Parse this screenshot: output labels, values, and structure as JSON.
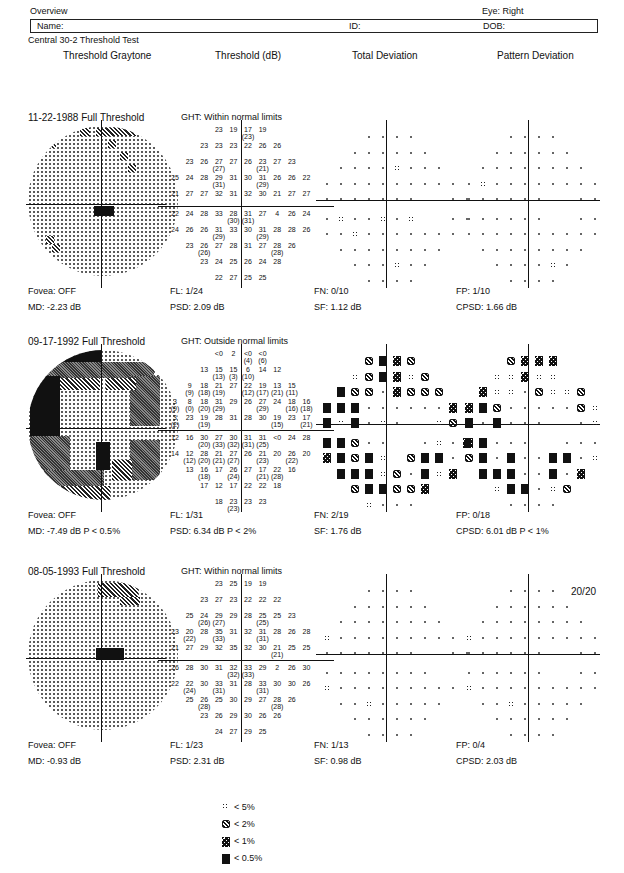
{
  "header": {
    "title": "Overview",
    "eye": "Eye: Right",
    "name_label": "Name:",
    "id_label": "ID:",
    "dob_label": "DOB:",
    "test_name": "Central 30-2 Threshold Test"
  },
  "columns": {
    "graytone": "Threshold Graytone",
    "threshold": "Threshold (dB)",
    "total_dev": "Total Deviation",
    "pattern_dev": "Pattern Deviation"
  },
  "tests": [
    {
      "date_strategy": "11-22-1988 Full Threshold",
      "ght": "GHT: Within normal limits",
      "fovea": "Fovea: OFF",
      "md": "MD:  -2.23 dB",
      "fl": "FL: 1/24",
      "psd": "PSD:  2.09 dB",
      "fn": "FN: 0/10",
      "sf": "SF:  1.12 dB",
      "fp": "FP: 1/10",
      "cpsd": "CPSD:  1.66 dB",
      "acuity": "",
      "threshold_rows": [
        [
          "",
          "",
          "",
          "23",
          "19",
          "17 (23)",
          "19",
          "",
          "",
          ""
        ],
        [
          "",
          "",
          "23",
          "23",
          "23",
          "22",
          "26",
          "26",
          "",
          ""
        ],
        [
          "",
          "23",
          "26",
          "27 (27)",
          "27",
          "26",
          "23 (21)",
          "27",
          "23",
          ""
        ],
        [
          "25",
          "24",
          "28",
          "29 (31)",
          "31",
          "30",
          "31 (29)",
          "26",
          "26",
          "22"
        ],
        [
          "21",
          "27",
          "27",
          "32",
          "31",
          "32",
          "30",
          "21",
          "27",
          "27"
        ],
        [
          "22",
          "24",
          "28",
          "33",
          "28 (30)",
          "31 (31)",
          "27",
          "4",
          "26",
          "24"
        ],
        [
          "24",
          "26",
          "26",
          "31 (29)",
          "33",
          "30",
          "31 (29)",
          "28",
          "28",
          "26"
        ],
        [
          "",
          "23",
          "26 (26)",
          "27",
          "28",
          "31",
          "27",
          "28 (28)",
          "26",
          ""
        ],
        [
          "",
          "",
          "23",
          "24",
          "25",
          "26",
          "24",
          "28",
          "",
          ""
        ],
        [
          "",
          "",
          "",
          "22",
          "27",
          "25",
          "25",
          "",
          "",
          ""
        ]
      ],
      "total_dev_rows": [
        "   ....   ",
        "  ......  ",
        " ....a... ",
        "..........",
        ".......  ..",
        ".a..a.a  ..",
        "..a.......",
        " ........ ",
        "  ...a..  ",
        "   ....   "
      ],
      "pattern_dev_rows": [
        "   ....   ",
        "  ......  ",
        " ........ ",
        ".a........",
        "......  ..",
        "......  ..",
        "..........",
        " ........ ",
        "  ....a.  ",
        "   ....   "
      ]
    },
    {
      "date_strategy": "09-17-1992 Full Threshold",
      "ght": "GHT: Outside normal limits",
      "fovea": "Fovea: OFF",
      "md": "MD:  -7.49 dB  P < 0.5%",
      "fl": "FL: 1/31",
      "psd": "PSD:  6.34 dB  P < 2%",
      "fn": "FN: 2/19",
      "sf": "SF:  1.76 dB",
      "fp": "FP: 0/18",
      "cpsd": "CPSD:  6.01 dB  P < 1%",
      "acuity": "",
      "threshold_rows": [
        [
          "",
          "",
          "",
          "<0",
          "2",
          "<0 (4)",
          "<0 (6)",
          "",
          "",
          ""
        ],
        [
          "",
          "",
          "13",
          "15 (13)",
          "15 (3)",
          "6 (10)",
          "14",
          "12",
          "",
          ""
        ],
        [
          "",
          "9 (9)",
          "18 (18)",
          "21 (19)",
          "27",
          "22 (12)",
          "19 (17)",
          "13 (21)",
          "15 (11)",
          ""
        ],
        [
          "3 (9)",
          "8 (0)",
          "18 (20)",
          "31 (29)",
          "29",
          "26",
          "27 (29)",
          "24",
          "18 (16)",
          "16 (18)"
        ],
        [
          "3 (2)",
          "23",
          "19 (19)",
          "28",
          "31",
          "28",
          "30",
          "19 (15)",
          "23",
          "17 (21)"
        ],
        [
          "12",
          "16",
          "30 (20)",
          "27 (33)",
          "30 (32)",
          "31 (31)",
          "31 (25)",
          "<0",
          "24",
          "28"
        ],
        [
          "14",
          "12 (12)",
          "28 (20)",
          "21 (21)",
          "27 (27)",
          "26",
          "21 (23)",
          "20",
          "26 (22)",
          "20"
        ],
        [
          "",
          "13",
          "16 (18)",
          "17",
          "26 (24)",
          "27",
          "17 (21)",
          "22 (28)",
          "16",
          ""
        ],
        [
          "",
          "",
          "17",
          "12",
          "17",
          "22",
          "22",
          "18",
          "",
          ""
        ],
        [
          "",
          "",
          "",
          "18",
          "23 (23)",
          "23",
          "23",
          "",
          "",
          ""
        ]
      ],
      "total_dev_rows": [
        "   bdcb   ",
        "  abdcab  ",
        " dbb.cbbb ",
        "ddd......c",
        "dad.a.  ab",
        "ddb..  .a.c",
        "cdbda bdd.",
        " dddab.dac",
        "  bddbbc  ",
        "   a...   "
      ],
      "pattern_dev_rows": [
        "   bccc   ",
        "  aacaa   ",
        " caa.baab ",
        "cdb.....ba",
        "d.d...  .a",
        "cd...  ...",
        "bd.d..dd.a",
        " ddd..d.c ",
        "  add.ab  ",
        "   ....   "
      ]
    },
    {
      "date_strategy": "08-05-1993 Full Threshold",
      "ght": "GHT: Within normal limits",
      "fovea": "Fovea: OFF",
      "md": "MD:  -0.93 dB",
      "fl": "FL: 1/23",
      "psd": "PSD:  2.31 dB",
      "fn": "FN: 1/13",
      "sf": "SF:  0.98 dB",
      "fp": "FP: 0/4",
      "cpsd": "CPSD:  2.03 dB",
      "acuity": "20/20",
      "threshold_rows": [
        [
          "",
          "",
          "",
          "23",
          "25",
          "19",
          "19",
          "",
          "",
          ""
        ],
        [
          "",
          "",
          "23",
          "27",
          "23",
          "22",
          "22",
          "22",
          "",
          ""
        ],
        [
          "",
          "25",
          "24 (26)",
          "29 (27)",
          "29",
          "28",
          "25 (25)",
          "25",
          "23",
          ""
        ],
        [
          "23",
          "20 (22)",
          "28",
          "35 (33)",
          "31",
          "32",
          "31 (31)",
          "28",
          "26",
          "28"
        ],
        [
          "21",
          "27",
          "29",
          "32",
          "35",
          "32",
          "30",
          "21 (21)",
          "25",
          "25"
        ],
        [
          "26",
          "28",
          "30",
          "31",
          "32 (32)",
          "33 (33)",
          "29",
          "2",
          "26",
          "30"
        ],
        [
          "22",
          "22 (24)",
          "30",
          "33 (31)",
          "31",
          "28",
          "33 (31)",
          "30",
          "30",
          "26"
        ],
        [
          "",
          "25",
          "26 (28)",
          "25",
          "30",
          "29",
          "27",
          "28 (28)",
          "26",
          ""
        ],
        [
          "",
          "",
          "23",
          "26",
          "29",
          "30",
          "26",
          "26",
          "",
          ""
        ],
        [
          "",
          "",
          "",
          "24",
          "27",
          "29",
          "25",
          "",
          "",
          ""
        ]
      ],
      "total_dev_rows": [
        "   ....   ",
        "  ......  ",
        " ........ ",
        "a.........",
        ".......  ..",
        "........  ",
        "a.........",
        " ..a..... ",
        "  ......  ",
        "   ....   "
      ],
      "pattern_dev_rows": [
        "   ....   ",
        "  ......  ",
        " ........ ",
        "a.........",
        "......  ..",
        "......  ..",
        "a.........",
        " ..a..... ",
        "  ......  ",
        "   ....   "
      ]
    }
  ],
  "legend": [
    {
      "symbol": "a",
      "label": "< 5%"
    },
    {
      "symbol": "b",
      "label": "< 2%"
    },
    {
      "symbol": "c",
      "label": "< 1%"
    },
    {
      "symbol": "d",
      "label": "< 0.5%"
    }
  ]
}
